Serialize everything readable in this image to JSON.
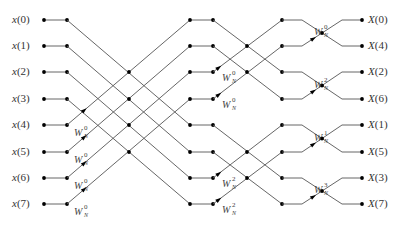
{
  "diagram": {
    "inputs": [
      "x(0)",
      "x(1)",
      "x(2)",
      "x(3)",
      "x(4)",
      "x(5)",
      "x(6)",
      "x(7)"
    ],
    "outputs": [
      "X(0)",
      "X(4)",
      "X(2)",
      "X(6)",
      "X(1)",
      "X(5)",
      "X(3)",
      "X(7)"
    ],
    "twiddles": {
      "stage1": [
        {
          "row": 4,
          "base": "W",
          "sub": "N",
          "sup": "0"
        },
        {
          "row": 5,
          "base": "W",
          "sub": "N",
          "sup": "0"
        },
        {
          "row": 6,
          "base": "W",
          "sub": "N",
          "sup": "0"
        },
        {
          "row": 7,
          "base": "W",
          "sub": "N",
          "sup": "0"
        }
      ],
      "stage2": [
        {
          "row": 2,
          "base": "W",
          "sub": "N",
          "sup": "0"
        },
        {
          "row": 3,
          "base": "W",
          "sub": "N",
          "sup": "0"
        },
        {
          "row": 6,
          "base": "W",
          "sub": "N",
          "sup": "2"
        },
        {
          "row": 7,
          "base": "W",
          "sub": "N",
          "sup": "2"
        }
      ],
      "stage3": [
        {
          "row": 1,
          "base": "W",
          "sub": "N",
          "sup": "0"
        },
        {
          "row": 3,
          "base": "W",
          "sub": "N",
          "sup": "2"
        },
        {
          "row": 5,
          "base": "W",
          "sub": "N",
          "sup": "1"
        },
        {
          "row": 7,
          "base": "W",
          "sub": "N",
          "sup": "3"
        }
      ]
    },
    "colors": {
      "line": "#555555",
      "node": "#000000",
      "text": "#333333"
    }
  }
}
